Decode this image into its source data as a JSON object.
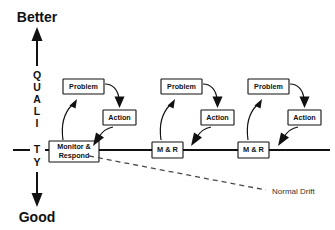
{
  "diagram": {
    "background_color": "#ffffff",
    "line_color": "#111111",
    "drift_color": "#4a4a4a"
  },
  "axis": {
    "top_label": "Better",
    "bottom_label": "Good",
    "vertical_label": "QUALITY",
    "letters": [
      "Q",
      "U",
      "A",
      "L",
      "I",
      "T",
      "Y"
    ],
    "top_arrow_icon": "arrow-up-icon",
    "bottom_arrow_icon": "arrow-down-icon"
  },
  "baseline": {
    "label": "performance-baseline"
  },
  "cycles": [
    {
      "id": "cycle-1",
      "monitor_label_line1": "Monitor &",
      "monitor_label_line2": "Respond",
      "monitor_single_line": "",
      "problem_label": "Problem",
      "action_label": "Action"
    },
    {
      "id": "cycle-2",
      "monitor_label_line1": "",
      "monitor_label_line2": "",
      "monitor_single_line": "M & R",
      "problem_label": "Problem",
      "action_label": "Action"
    },
    {
      "id": "cycle-3",
      "monitor_label_line1": "",
      "monitor_label_line2": "",
      "monitor_single_line": "M & R",
      "problem_label": "Problem",
      "action_label": "Action"
    }
  ],
  "drift": {
    "label": "Normal Drift",
    "style": "dashed"
  }
}
